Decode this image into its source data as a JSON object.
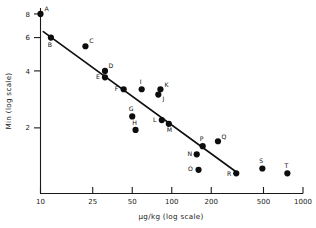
{
  "chart_data": {
    "type": "scatter",
    "title": "",
    "xlabel": "µg/kg (log scale)",
    "ylabel": "Min (log scale)",
    "xscale": "log",
    "yscale": "log",
    "xlim": [
      10,
      1000
    ],
    "ylim": [
      0.9,
      8.6
    ],
    "grid": false,
    "legend": "none",
    "xticks": [
      10,
      25,
      50,
      100,
      200,
      500,
      1000
    ],
    "xticklabels": [
      "10",
      "25",
      "50",
      "100",
      "200",
      "500",
      "1000"
    ],
    "yticks": [
      8,
      6,
      4,
      2
    ],
    "yticklabels": [
      "8",
      "6",
      "4",
      "2"
    ],
    "point_labels": [
      "A",
      "B",
      "C",
      "D",
      "E",
      "F",
      "G",
      "H",
      "I",
      "J",
      "K",
      "L",
      "M",
      "N",
      "O",
      "P",
      "Q",
      "R",
      "S",
      "T"
    ],
    "points": [
      {
        "label": "A",
        "x": 10,
        "y": 8.0
      },
      {
        "label": "B",
        "x": 12,
        "y": 6.0
      },
      {
        "label": "C",
        "x": 22,
        "y": 5.4
      },
      {
        "label": "D",
        "x": 31,
        "y": 4.0
      },
      {
        "label": "E",
        "x": 31,
        "y": 3.7
      },
      {
        "label": "F",
        "x": 43,
        "y": 3.2
      },
      {
        "label": "G",
        "x": 50,
        "y": 2.3
      },
      {
        "label": "H",
        "x": 53,
        "y": 1.95
      },
      {
        "label": "I",
        "x": 59,
        "y": 3.2
      },
      {
        "label": "J",
        "x": 79,
        "y": 3.0
      },
      {
        "label": "K",
        "x": 82,
        "y": 3.2
      },
      {
        "label": "L",
        "x": 84,
        "y": 2.2
      },
      {
        "label": "M",
        "x": 95,
        "y": 2.1
      },
      {
        "label": "N",
        "x": 155,
        "y": 1.45
      },
      {
        "label": "O",
        "x": 160,
        "y": 1.2
      },
      {
        "label": "P",
        "x": 172,
        "y": 1.6
      },
      {
        "label": "Q",
        "x": 225,
        "y": 1.7
      },
      {
        "label": "R",
        "x": 310,
        "y": 1.15
      },
      {
        "label": "S",
        "x": 490,
        "y": 1.22
      },
      {
        "label": "T",
        "x": 760,
        "y": 1.15
      }
    ],
    "fit_line": {
      "type": "linear-regression-loglog",
      "x_start": 10.5,
      "y_start": 6.45,
      "x_end": 305,
      "y_end": 1.18
    },
    "colors": {
      "axis": "#1a1a1a",
      "marker": "#0d0d0d",
      "fit_line": "#111111",
      "background": "#ffffff"
    }
  }
}
